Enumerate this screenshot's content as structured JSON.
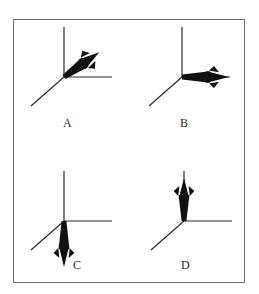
{
  "figure": {
    "background_color": "#ffffff",
    "border_color": "#6b6b6b",
    "ink_color": "#111111",
    "axis_color": "#2b2b2b",
    "label_color": "#2a2a2a"
  },
  "panels": [
    {
      "id": "A",
      "label": "A",
      "vector_direction": "up-right diagonal",
      "arrow_angle_deg": 35,
      "axes": [
        "vertical-up",
        "horizontal-right",
        "diagonal-down-left"
      ]
    },
    {
      "id": "B",
      "label": "B",
      "vector_direction": "right",
      "arrow_angle_deg": 0,
      "axes": [
        "vertical-up",
        "horizontal-right",
        "diagonal-down-left"
      ]
    },
    {
      "id": "C",
      "label": "C",
      "vector_direction": "down",
      "arrow_angle_deg": 270,
      "axes": [
        "vertical-up",
        "horizontal-right",
        "diagonal-down-left"
      ]
    },
    {
      "id": "D",
      "label": "D",
      "vector_direction": "up",
      "arrow_angle_deg": 90,
      "axes": [
        "vertical-up",
        "horizontal-right",
        "diagonal-down-left"
      ]
    }
  ]
}
